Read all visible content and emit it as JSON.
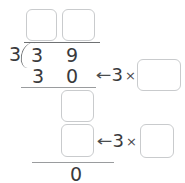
{
  "problem": {
    "divisor": "3",
    "divisor_bracket": ")",
    "dividend_digits": [
      "3",
      "9"
    ],
    "first_subtrahend_digits": [
      "3",
      "0"
    ],
    "remainder": "0"
  },
  "quotient_boxes": [
    {
      "label": "",
      "name": "quotient-tens-box"
    },
    {
      "label": "",
      "name": "quotient-ones-box"
    }
  ],
  "work_boxes": [
    {
      "label": "",
      "name": "first-difference-box"
    },
    {
      "label": "",
      "name": "second-subtrahend-box"
    }
  ],
  "annotations": [
    {
      "arrow": "←",
      "multiplier": "3",
      "times_symbol": "×",
      "box_value": ""
    },
    {
      "arrow": "←",
      "multiplier": "3",
      "times_symbol": "×",
      "box_value": ""
    }
  ],
  "colors": {
    "box_border": "#c9cbcd",
    "rule": "#9a9c9e",
    "digit": "#3a3a3c",
    "annotation": "#4a4c4e",
    "background": "#ffffff"
  }
}
